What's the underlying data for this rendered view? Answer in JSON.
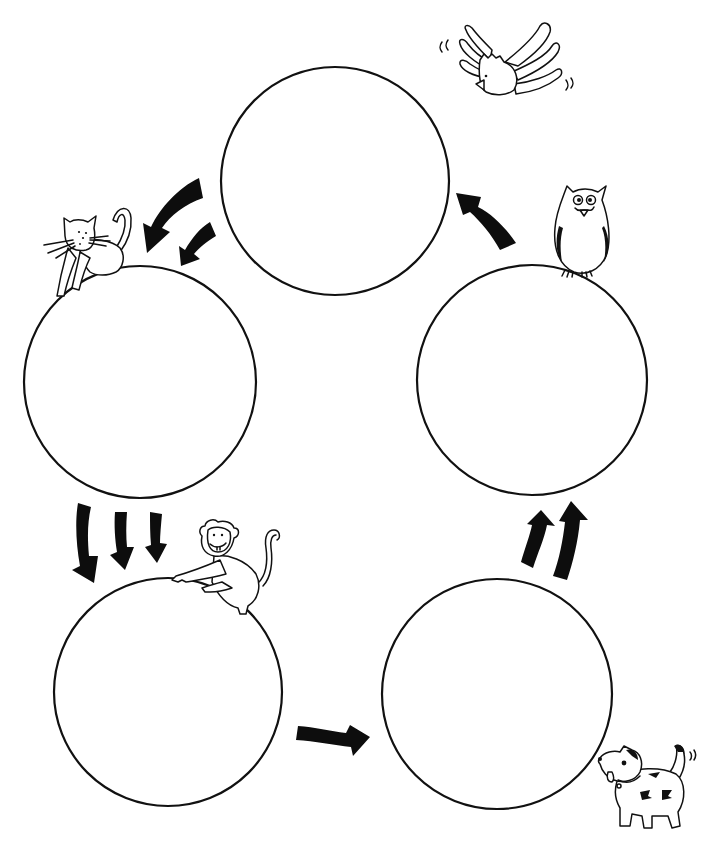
{
  "diagram": {
    "type": "cycle",
    "colors": {
      "ink": "#111111",
      "background": "#ffffff",
      "arrow": "#0d0d0d"
    },
    "nodes": [
      {
        "id": "top",
        "position": "top-center",
        "label": "",
        "animal": "flying-bird",
        "cx": 335,
        "cy": 181,
        "r": 114
      },
      {
        "id": "right",
        "position": "middle-right",
        "label": "",
        "animal": "owl",
        "cx": 532,
        "cy": 380,
        "r": 115
      },
      {
        "id": "bottom-right",
        "position": "bottom-right",
        "label": "",
        "animal": "dog",
        "cx": 497,
        "cy": 694,
        "r": 115
      },
      {
        "id": "bottom-left",
        "position": "bottom-left",
        "label": "",
        "animal": "monkey",
        "cx": 168,
        "cy": 692,
        "r": 114
      },
      {
        "id": "left",
        "position": "middle-left",
        "label": "",
        "animal": "cat",
        "cx": 140,
        "cy": 382,
        "r": 116
      }
    ],
    "edges": [
      {
        "from": "top",
        "to": "left",
        "arrow_count": 2,
        "direction": "down-left"
      },
      {
        "from": "left",
        "to": "bottom-left",
        "arrow_count": 3,
        "direction": "down"
      },
      {
        "from": "bottom-left",
        "to": "bottom-right",
        "arrow_count": 1,
        "direction": "right"
      },
      {
        "from": "bottom-right",
        "to": "right",
        "arrow_count": 2,
        "direction": "up"
      },
      {
        "from": "right",
        "to": "top",
        "arrow_count": 1,
        "direction": "up-left"
      }
    ],
    "animals": [
      "flying-bird",
      "owl",
      "dog",
      "monkey",
      "cat"
    ]
  }
}
